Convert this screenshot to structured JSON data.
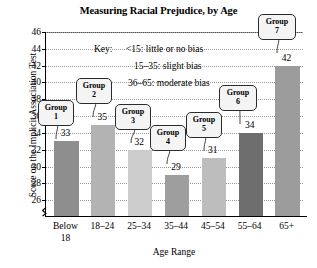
{
  "chart_data": {
    "type": "bar",
    "title": "Measuring Racial Prejudice, by Age",
    "xlabel": "Age Range",
    "ylabel": "Score on the Implicit Association Test",
    "categories": [
      "Below 18",
      "18–24",
      "25–34",
      "35–44",
      "45–54",
      "55–64",
      "65+"
    ],
    "values": [
      33,
      35,
      32,
      29,
      31,
      34,
      42
    ],
    "ylim": [
      24,
      46
    ],
    "yticks": [
      26,
      28,
      30,
      32,
      34,
      36,
      38,
      40,
      42,
      44,
      46
    ],
    "grid": true,
    "axis_break": true,
    "legend": "none",
    "series": [
      {
        "name": "Score on the Implicit Association Test",
        "values": [
          33,
          35,
          32,
          29,
          31,
          34,
          42
        ]
      }
    ],
    "bar_colors": [
      "#8e8e8e",
      "#b3b3b3",
      "#cccccc",
      "#9e9e9e",
      "#bdbdbd",
      "#6e6e6e",
      "#9c9c9c"
    ],
    "annotations": [
      {
        "label": "Group\n1",
        "value": 33
      },
      {
        "label": "Group\n2",
        "value": 35
      },
      {
        "label": "Group\n3",
        "value": 32
      },
      {
        "label": "Group\n4",
        "value": 29
      },
      {
        "label": "Group\n5",
        "value": 31
      },
      {
        "label": "Group\n6",
        "value": 34
      },
      {
        "label": "Group\n7",
        "value": 42
      }
    ]
  },
  "title": "Measuring Racial Prejudice, by Age",
  "axes": {
    "y_title": "Score on the Implicit Association Test",
    "x_title": "Age Range",
    "y_ticks": [
      "46",
      "44",
      "42",
      "40",
      "38",
      "36",
      "34",
      "32",
      "30",
      "28",
      "26"
    ],
    "x_ticks": [
      "Below\n18",
      "18–24",
      "25–34",
      "35–44",
      "45–54",
      "55–64",
      "65+"
    ]
  },
  "key": {
    "label": "Key:",
    "line1": "<15: little or no bias",
    "line2": "15–35: slight bias",
    "line3": "36–65: moderate bias"
  },
  "bars": [
    {
      "value_label": "33",
      "group_label": "Group\n1"
    },
    {
      "value_label": "35",
      "group_label": "Group\n2"
    },
    {
      "value_label": "32",
      "group_label": "Group\n3"
    },
    {
      "value_label": "29",
      "group_label": "Group\n4"
    },
    {
      "value_label": "31",
      "group_label": "Group\n5"
    },
    {
      "value_label": "34",
      "group_label": "Group\n6"
    },
    {
      "value_label": "42",
      "group_label": "Group\n7"
    }
  ]
}
